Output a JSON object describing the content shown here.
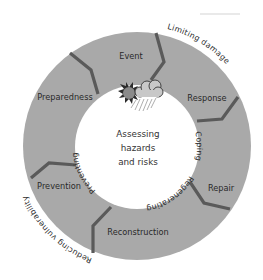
{
  "diagram": {
    "colors": {
      "ring": "#a9a9a9",
      "divider": "#5a5a5a",
      "center": "#ffffff",
      "text": "#2a2a2a"
    },
    "center": {
      "lines": [
        "Assessing",
        "hazards",
        "and risks"
      ]
    },
    "icon": "sun-cloud-rain-icon",
    "segments": [
      {
        "label": "Event"
      },
      {
        "label": "Response"
      },
      {
        "label": "Repair"
      },
      {
        "label": "Reconstruction"
      },
      {
        "label": "Prevention"
      },
      {
        "label": "Preparedness"
      }
    ],
    "inner_arc_labels": [
      {
        "label": "Coping"
      },
      {
        "label": "Regenerating"
      },
      {
        "label": "Preventing"
      }
    ],
    "outer_arc_labels": [
      {
        "label": "Limiting damage"
      },
      {
        "label": "Reducing vulnerability"
      }
    ]
  }
}
